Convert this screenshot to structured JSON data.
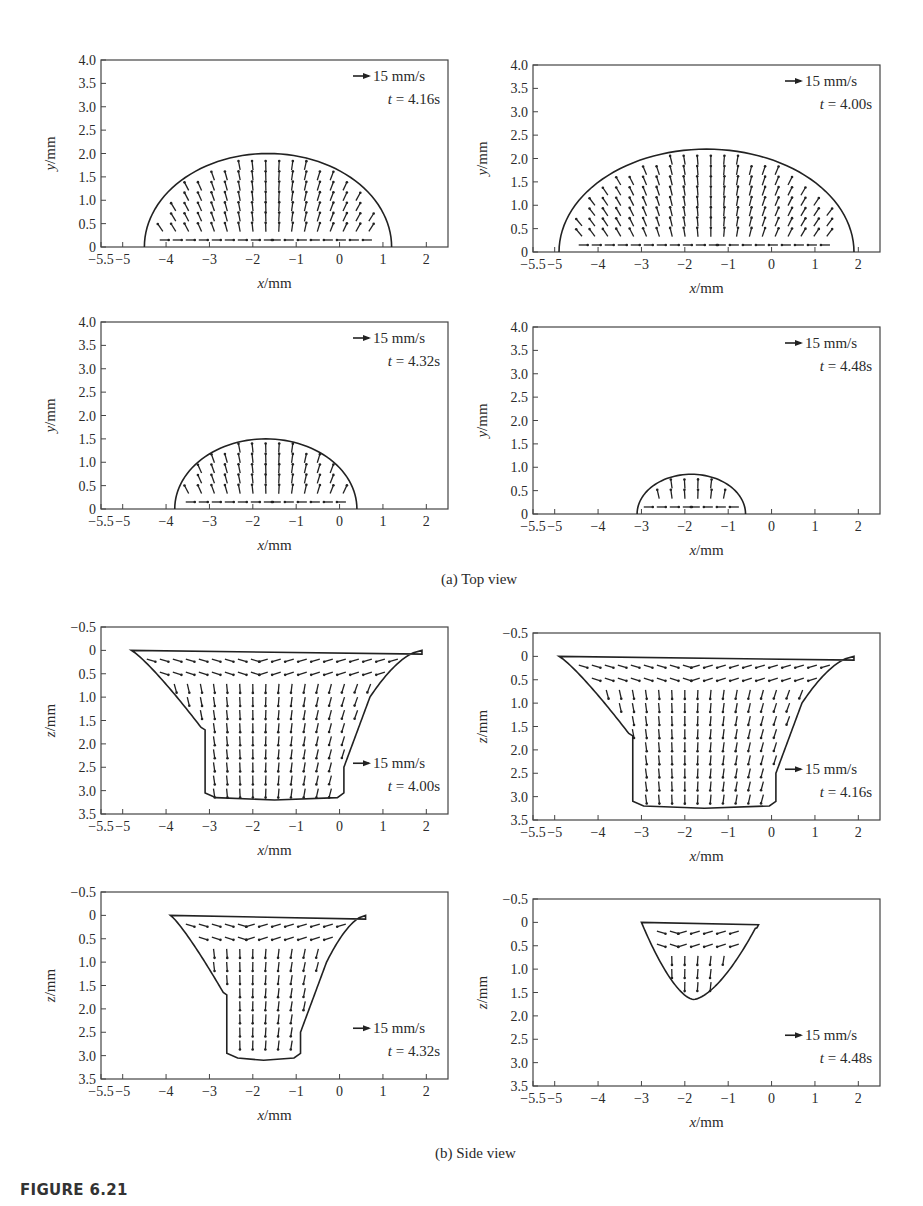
{
  "figure": {
    "label": "FIGURE 6.21",
    "caption_a": "(a) Top view",
    "caption_b": "(b) Side view"
  },
  "chart_data": [
    {
      "type": "quiver",
      "view": "top",
      "position": "top-left",
      "title": "",
      "xlabel": "x/mm",
      "ylabel": "y/mm",
      "xticks": [
        "-5.5",
        "-5",
        "-4",
        "-3",
        "-2",
        "-1",
        "0",
        "1",
        "2"
      ],
      "yticks": [
        "0",
        "0.5",
        "1.0",
        "1.5",
        "2.0",
        "2.5",
        "3.0",
        "3.5",
        "4.0"
      ],
      "xlim": [
        -5.5,
        2.5
      ],
      "ylim": [
        0,
        4.0
      ],
      "reference_vector": "15 mm/s",
      "time_label": "t = 4.16s",
      "pool_boundary": {
        "x_min": -4.5,
        "x_max": 1.2,
        "peak_x": -1.6,
        "peak_y": 2.0
      }
    },
    {
      "type": "quiver",
      "view": "top",
      "position": "top-right",
      "title": "",
      "xlabel": "x/mm",
      "ylabel": "y/mm",
      "xticks": [
        "-5.5",
        "-5",
        "-4",
        "-3",
        "-2",
        "-1",
        "0",
        "1",
        "2"
      ],
      "yticks": [
        "0",
        "0.5",
        "1.0",
        "1.5",
        "2.0",
        "2.5",
        "3.0",
        "3.5",
        "4.0"
      ],
      "xlim": [
        -5.5,
        2.5
      ],
      "ylim": [
        0,
        4.0
      ],
      "reference_vector": "15 mm/s",
      "time_label": "t = 4.00s",
      "pool_boundary": {
        "x_min": -4.9,
        "x_max": 1.9,
        "peak_x": -1.4,
        "peak_y": 2.2
      }
    },
    {
      "type": "quiver",
      "view": "top",
      "position": "middle-left",
      "title": "",
      "xlabel": "x/mm",
      "ylabel": "y/mm",
      "xticks": [
        "-5.5",
        "-5",
        "-4",
        "-3",
        "-2",
        "-1",
        "0",
        "1",
        "2"
      ],
      "yticks": [
        "0",
        "0.5",
        "1.0",
        "1.5",
        "2.0",
        "2.5",
        "3.0",
        "3.5",
        "4.0"
      ],
      "xlim": [
        -5.5,
        2.5
      ],
      "ylim": [
        0,
        4.0
      ],
      "reference_vector": "15 mm/s",
      "time_label": "t = 4.32s",
      "pool_boundary": {
        "x_min": -3.8,
        "x_max": 0.4,
        "peak_x": -1.6,
        "peak_y": 1.5
      }
    },
    {
      "type": "quiver",
      "view": "top",
      "position": "middle-right",
      "title": "",
      "xlabel": "x/mm",
      "ylabel": "y/mm",
      "xticks": [
        "-5.5",
        "-5",
        "-4",
        "-3",
        "-2",
        "-1",
        "0",
        "1",
        "2"
      ],
      "yticks": [
        "0",
        "0.5",
        "1.0",
        "1.5",
        "2.0",
        "2.5",
        "3.0",
        "3.5",
        "4.0"
      ],
      "xlim": [
        -5.5,
        2.5
      ],
      "ylim": [
        0,
        4.0
      ],
      "reference_vector": "15 mm/s",
      "time_label": "t = 4.48s",
      "pool_boundary": {
        "x_min": -3.1,
        "x_max": -0.6,
        "peak_x": -1.8,
        "peak_y": 0.85
      }
    },
    {
      "type": "quiver",
      "view": "side",
      "position": "lower-left",
      "title": "",
      "xlabel": "x/mm",
      "ylabel": "z/mm",
      "xticks": [
        "-5.5",
        "-5",
        "-4",
        "-3",
        "-2",
        "-1",
        "0",
        "1",
        "2"
      ],
      "yticks": [
        "-0.5",
        "0",
        "0.5",
        "1.0",
        "1.5",
        "2.0",
        "2.5",
        "3.0",
        "3.5"
      ],
      "xlim": [
        -5.5,
        2.5
      ],
      "ylim": [
        3.5,
        -0.5
      ],
      "reference_vector": "15 mm/s",
      "time_label": "t = 4.00s",
      "pool_boundary": {
        "top_x_min": -4.8,
        "top_x_max": 1.9,
        "bottom_x_min": -3.1,
        "bottom_x_max": 0.1,
        "depth": 3.2
      }
    },
    {
      "type": "quiver",
      "view": "side",
      "position": "lower-right",
      "title": "",
      "xlabel": "x/mm",
      "ylabel": "z/mm",
      "xticks": [
        "-5.5",
        "-5",
        "-4",
        "-3",
        "-2",
        "-1",
        "0",
        "1",
        "2"
      ],
      "yticks": [
        "-0.5",
        "0",
        "0.5",
        "1.0",
        "1.5",
        "2.0",
        "2.5",
        "3.0",
        "3.5"
      ],
      "xlim": [
        -5.5,
        2.5
      ],
      "ylim": [
        3.5,
        -0.5
      ],
      "reference_vector": "15 mm/s",
      "time_label": "t = 4.16s",
      "pool_boundary": {
        "top_x_min": -4.9,
        "top_x_max": 1.9,
        "bottom_x_min": -3.2,
        "bottom_x_max": 0.1,
        "depth": 3.25
      }
    },
    {
      "type": "quiver",
      "view": "side",
      "position": "bottom-left",
      "title": "",
      "xlabel": "x/mm",
      "ylabel": "z/mm",
      "xticks": [
        "-5.5",
        "-5",
        "-4",
        "-3",
        "-2",
        "-1",
        "0",
        "1",
        "2"
      ],
      "yticks": [
        "-0.5",
        "0",
        "0.5",
        "1.0",
        "1.5",
        "2.0",
        "2.5",
        "3.0",
        "3.5"
      ],
      "xlim": [
        -5.5,
        2.5
      ],
      "ylim": [
        3.5,
        -0.5
      ],
      "reference_vector": "15 mm/s",
      "time_label": "t = 4.32s",
      "pool_boundary": {
        "top_x_min": -3.9,
        "top_x_max": 0.6,
        "bottom_x_min": -2.6,
        "bottom_x_max": -0.9,
        "depth": 3.1
      }
    },
    {
      "type": "quiver",
      "view": "side",
      "position": "bottom-right",
      "title": "",
      "xlabel": "x/mm",
      "ylabel": "z/mm",
      "xticks": [
        "-5.5",
        "-5",
        "-4",
        "-3",
        "-2",
        "-1",
        "0",
        "1",
        "2"
      ],
      "yticks": [
        "-0.5",
        "0",
        "0.5",
        "1.0",
        "1.5",
        "2.0",
        "2.5",
        "3.0",
        "3.5"
      ],
      "xlim": [
        -5.5,
        2.5
      ],
      "ylim": [
        3.5,
        -0.5
      ],
      "reference_vector": "15 mm/s",
      "time_label": "t = 4.48s",
      "pool_boundary": {
        "top_x_min": -3.0,
        "top_x_max": -0.3,
        "bottom_x": -1.8,
        "depth": 1.65
      }
    }
  ]
}
